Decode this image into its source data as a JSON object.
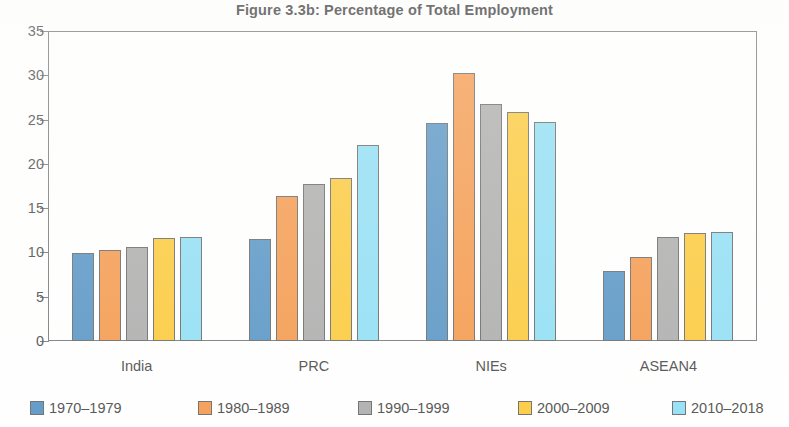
{
  "chart_data": {
    "type": "bar",
    "title": "Figure 3.3b: Percentage of Total Employment",
    "xlabel": "",
    "ylabel": "",
    "categories": [
      "India",
      "PRC",
      "NIEs",
      "ASEAN4"
    ],
    "series": [
      {
        "name": "1970–1979",
        "color": "#4a8cc0",
        "values": [
          9.9,
          11.5,
          24.6,
          7.9
        ]
      },
      {
        "name": "1980–1989",
        "color": "#f4913e",
        "values": [
          10.3,
          16.4,
          30.3,
          9.5
        ]
      },
      {
        "name": "1990–1999",
        "color": "#a6a6a6",
        "values": [
          10.6,
          17.7,
          26.8,
          11.7
        ]
      },
      {
        "name": "2000–2009",
        "color": "#fcc52a",
        "values": [
          11.6,
          18.4,
          25.9,
          12.2
        ]
      },
      {
        "name": "2010–2018",
        "color": "#87dcf4",
        "values": [
          11.8,
          22.1,
          24.7,
          12.3
        ]
      }
    ],
    "ylim": [
      0,
      35
    ],
    "yticks": [
      0,
      5,
      10,
      15,
      20,
      25,
      30,
      35
    ],
    "ytick_labels": [
      "0",
      "5",
      "10",
      "15",
      "20",
      "25",
      "30",
      "35"
    ],
    "grid": false,
    "legend_position": "bottom"
  }
}
